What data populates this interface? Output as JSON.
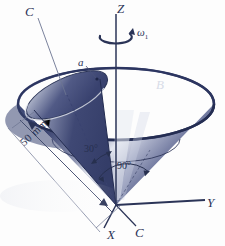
{
  "figure": {
    "type": "engineering-diagram",
    "background_color": "#fdfdfd",
    "cone_dark_color": "#3b4573",
    "cone_mid_color": "#57618c",
    "cone_light_color": "#c9cfdf",
    "line_color": "#2b3457",
    "label_light_color": "#d8dce8"
  },
  "labels": {
    "axis_z": "Z",
    "axis_y": "Y",
    "axis_x": "X",
    "cone_c_top": "C",
    "cone_c_bottom": "C",
    "point_a": "a",
    "cone_b": "B",
    "omega": "ω",
    "omega_subscript": "1",
    "angle_30": "30°",
    "angle_90": "90°",
    "dimension_50mm": "50 mm"
  },
  "icons": {
    "rotation_arrow": "curved-rotation-arrow-icon",
    "arrowhead": "arrowhead-icon"
  }
}
